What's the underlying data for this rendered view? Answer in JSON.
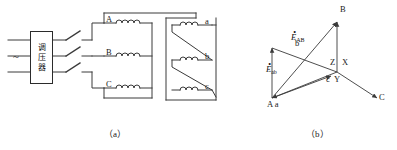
{
  "figure": {
    "type": "transformer-connection-and-phasor-diagram",
    "captions": {
      "left": "（a）",
      "right": "（b）"
    }
  },
  "circuit": {
    "source_symbol": "~",
    "regulator": {
      "name": "voltage-regulator-box",
      "characters": [
        "调",
        "压",
        "器"
      ]
    },
    "switches": [
      {
        "name": "switch-a",
        "state": "open"
      },
      {
        "name": "switch-b",
        "state": "open"
      },
      {
        "name": "switch-c",
        "state": "open"
      }
    ],
    "primary_windings": [
      {
        "label": "A"
      },
      {
        "label": "B"
      },
      {
        "label": "C"
      }
    ],
    "secondary_windings": [
      {
        "label": "a"
      },
      {
        "label": "b"
      },
      {
        "label": "c"
      }
    ],
    "secondary_connection": "zigzag"
  },
  "phasor": {
    "vertices": [
      {
        "name": "vertex-b",
        "label": "b"
      },
      {
        "name": "vertex-B",
        "label": "B"
      },
      {
        "name": "vertex-Aa",
        "label": "A a"
      },
      {
        "name": "vertex-C",
        "label": "C"
      },
      {
        "name": "vertex-c",
        "label": "c"
      },
      {
        "name": "vertex-X",
        "label": "X"
      },
      {
        "name": "vertex-Y",
        "label": "Y"
      },
      {
        "name": "vertex-Z",
        "label": "Z"
      }
    ],
    "emf_labels": [
      {
        "name": "emf-AB",
        "symbol": "E",
        "dot": "•",
        "subscript": "AB"
      },
      {
        "name": "emf-ab",
        "symbol": "E",
        "dot": "•",
        "subscript": "ab"
      }
    ]
  },
  "style": {
    "line_color": "#3a3a3a",
    "box_color": "#2b2b2b",
    "text_color": "#1a1a1a"
  }
}
